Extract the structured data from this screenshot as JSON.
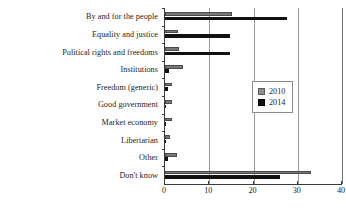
{
  "chart_data": {
    "type": "bar",
    "orientation": "horizontal",
    "title": "",
    "xlabel": "",
    "ylabel": "",
    "xlim": [
      0,
      40
    ],
    "xticks": [
      0,
      10,
      20,
      30,
      40
    ],
    "grid": true,
    "legend_position": "right",
    "categories": [
      "By and for the people",
      "Equality and justice",
      "Political rights and freedoms",
      "Institutions",
      "Freedom (generic)",
      "Good government",
      "Market economy",
      "Libertarian",
      "Other",
      "Don't know"
    ],
    "series": [
      {
        "name": "2010",
        "color": "#787878",
        "values": [
          15.2,
          3.0,
          3.2,
          4.0,
          1.6,
          1.6,
          1.6,
          1.2,
          2.6,
          33.0
        ]
      },
      {
        "name": "2014",
        "color": "#111111",
        "values": [
          27.5,
          14.6,
          14.6,
          1.0,
          0.6,
          0.3,
          0.3,
          0.3,
          0.6,
          26.0
        ]
      }
    ]
  },
  "legend": {
    "items": [
      {
        "label": "2010",
        "swatch": "gray-square-swatch"
      },
      {
        "label": "2014",
        "swatch": "black-square-swatch"
      }
    ]
  },
  "axis": {
    "tick_labels": [
      "0",
      "10",
      "20",
      "30",
      "40"
    ]
  }
}
